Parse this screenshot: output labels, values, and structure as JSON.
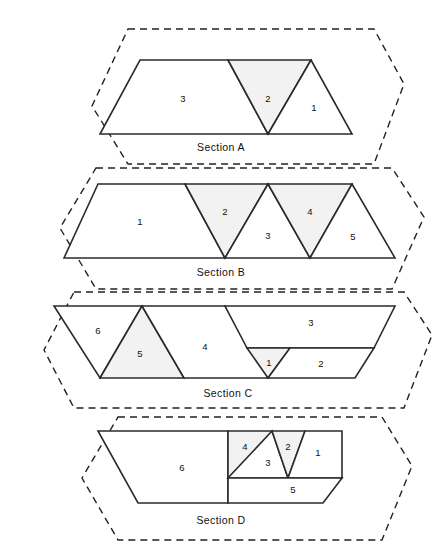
{
  "figure": {
    "title": "",
    "background_color": "#ffffff",
    "outline_color": "#222222",
    "region_stroke_color": "#2b2b2b",
    "region_fill_plain": "#ffffff",
    "region_fill_tinted": "#f2f2f2"
  },
  "sections": [
    {
      "id": "A",
      "caption": "Section A",
      "caption_pos": {
        "x": 221,
        "y": 148
      },
      "hex": "128,29 374,29 404,84 374,164 128,164 92,106",
      "regions": [
        {
          "label": "3",
          "label_pos": {
            "x": 183,
            "y": 99
          },
          "tinted": false,
          "points": "140,60 228,60 268,134 100,134"
        },
        {
          "label": "2",
          "label_pos": {
            "x": 268,
            "y": 99
          },
          "tinted": true,
          "points": "228,60 311,60 268,134"
        },
        {
          "label": "1",
          "label_pos": {
            "x": 314,
            "y": 108
          },
          "tinted": false,
          "points": "311,60 352,134 268,134"
        }
      ]
    },
    {
      "id": "B",
      "caption": "Section B",
      "caption_pos": {
        "x": 221,
        "y": 273
      },
      "hex": "96,168 392,168 424,217 392,289 96,289 60,228",
      "regions": [
        {
          "label": "1",
          "label_pos": {
            "x": 140,
            "y": 222
          },
          "tinted": false,
          "points": "98,184 185,184 225,258 64,258"
        },
        {
          "label": "2",
          "label_pos": {
            "x": 225,
            "y": 212
          },
          "tinted": true,
          "points": "185,184 268,184 225,258"
        },
        {
          "label": "3",
          "label_pos": {
            "x": 268,
            "y": 236
          },
          "tinted": false,
          "points": "268,184 310,258 225,258"
        },
        {
          "label": "4",
          "label_pos": {
            "x": 310,
            "y": 212
          },
          "tinted": true,
          "points": "268,184 352,184 310,258"
        },
        {
          "label": "5",
          "label_pos": {
            "x": 353,
            "y": 237
          },
          "tinted": false,
          "points": "352,184 395,258 310,258"
        }
      ]
    },
    {
      "id": "C",
      "caption": "Section C",
      "caption_pos": {
        "x": 228,
        "y": 394
      },
      "hex": "74,292 404,292 432,335 404,408 74,408 44,350",
      "regions": [
        {
          "label": "6",
          "label_pos": {
            "x": 98,
            "y": 331
          },
          "tinted": false,
          "points": "54,306 142,306 100,378"
        },
        {
          "label": "5",
          "label_pos": {
            "x": 140,
            "y": 354
          },
          "tinted": true,
          "points": "142,306 184,378 100,378"
        },
        {
          "label": "4",
          "label_pos": {
            "x": 205,
            "y": 347
          },
          "tinted": false,
          "points": "142,306 225,306 268,378 184,378"
        },
        {
          "label": "3",
          "label_pos": {
            "x": 311,
            "y": 323
          },
          "tinted": false,
          "points": "225,306 395,306 374,348 247,348"
        },
        {
          "label": "1",
          "label_pos": {
            "x": 269,
            "y": 363
          },
          "tinted": true,
          "points": "247,348 290,348 268,378"
        },
        {
          "label": "2",
          "label_pos": {
            "x": 321,
            "y": 364
          },
          "tinted": false,
          "points": "290,348 374,348 355,378 268,378"
        }
      ]
    },
    {
      "id": "D",
      "caption": "Section D",
      "caption_pos": {
        "x": 221,
        "y": 521
      },
      "hex": "118,417 382,417 412,466 382,540 118,540 82,478",
      "regions": [
        {
          "label": "6",
          "label_pos": {
            "x": 182,
            "y": 468
          },
          "tinted": false,
          "points": "98,431 228,431 228,503 138,503"
        },
        {
          "label": "4",
          "label_pos": {
            "x": 245,
            "y": 447
          },
          "tinted": true,
          "points": "228,431 272,431 257,478 228,478"
        },
        {
          "label": "3",
          "label_pos": {
            "x": 268,
            "y": 463
          },
          "tinted": false,
          "points": "272,431 288,478 228,478"
        },
        {
          "label": "2",
          "label_pos": {
            "x": 288,
            "y": 447
          },
          "tinted": true,
          "points": "272,431 305,431 288,478"
        },
        {
          "label": "1",
          "label_pos": {
            "x": 318,
            "y": 453
          },
          "tinted": false,
          "points": "305,431 342,431 342,478 288,478"
        },
        {
          "label": "5",
          "label_pos": {
            "x": 293,
            "y": 490
          },
          "tinted": false,
          "points": "228,478 342,478 323,503 228,503"
        }
      ]
    }
  ]
}
